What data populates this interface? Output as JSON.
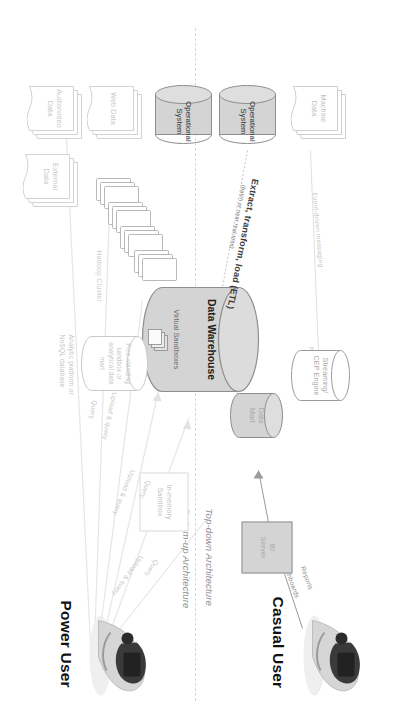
{
  "diagram": {
    "accent_fill": "#d4d4d4",
    "line_color": "#8e8e8e",
    "faint_color": "#cfcfcf"
  },
  "personas": {
    "casual": "Casual User",
    "power": "Power User"
  },
  "architecture_labels": {
    "top_down": "Top-down Architecture",
    "bottom_up": "Bottom-up Architecture"
  },
  "nodes": {
    "bi_server": "BI\nServer",
    "bi_server_l1": "BI",
    "bi_server_l2": "Server",
    "data_mart_l1": "Data",
    "data_mart_l2": "Mart",
    "data_warehouse": "Data Warehouse",
    "virtual_sandboxes": "Virtual Sandboxes",
    "streaming_l1": "Streaming/",
    "streaming_l2": "CEP Engine",
    "in_memory_l1": "In-memory",
    "in_memory_l2": "Sandbox",
    "free_standing_l1": "Free-standing",
    "free_standing_l2": "sandbox or",
    "free_standing_l3": "analytical data",
    "free_standing_l4": "mart",
    "analytic_platform_l1": "Analytic platform or",
    "analytic_platform_l2": "NoSQL database",
    "hadoop_cluster": "Hadoop Cluster",
    "machine_data_l1": "Machine",
    "machine_data_l2": "Data",
    "operational_system_1_l1": "Operational",
    "operational_system_1_l2": "System",
    "operational_system_2_l1": "Operational",
    "operational_system_2_l2": "System",
    "web_data": "Web Data",
    "audio_video_l1": "Audio/video",
    "audio_video_l2": "Data",
    "external_data_l1": "External",
    "external_data_l2": "Data"
  },
  "flows": {
    "reports": "Reports",
    "dashboards": "Dashboards",
    "alerts": "Alerts",
    "event_driven_messaging": "Event-driven messaging",
    "etl_main": "Extract, transform, load (ETL)",
    "etl_sub": "(batch or near real-time)",
    "upload_query_1": "Upload & query",
    "upload_query_2": "Upload & query",
    "upload_query_3": "Upload & query",
    "query_1": "Query",
    "query_2": "Query",
    "query_3": "Query"
  }
}
